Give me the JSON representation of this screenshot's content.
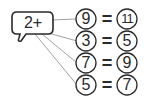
{
  "bubble": {
    "label": "2+"
  },
  "rows": [
    {
      "input": "9",
      "equals": "=",
      "output": "11"
    },
    {
      "input": "3",
      "equals": "=",
      "output": "5"
    },
    {
      "input": "7",
      "equals": "=",
      "output": "9"
    },
    {
      "input": "5",
      "equals": "=",
      "output": "7"
    }
  ],
  "colors": {
    "stroke": "#2a2a2a",
    "connector": "#8a8a8a",
    "background": "#ffffff"
  }
}
